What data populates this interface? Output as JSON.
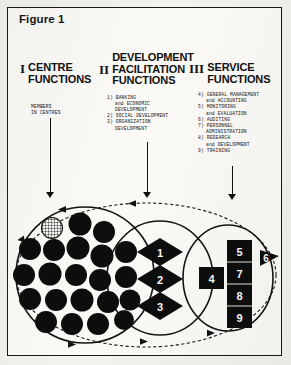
{
  "figure": {
    "title": "Figure 1"
  },
  "columns": [
    {
      "numeral": "I",
      "heading_pre": "",
      "heading_line1": "CENTRE",
      "heading_line2": "FUNCTIONS",
      "members": [
        "MEMBERS",
        " IN CENTRES"
      ],
      "items": []
    },
    {
      "numeral": "II",
      "heading_pre": "DEVELOPMENT",
      "heading_line1": "FACILITATION",
      "heading_line2": "FUNCTIONS",
      "members": [],
      "items": [
        {
          "num": "1)",
          "lines": [
            "BANKING",
            "and ECONOMIC",
            "DEVELOPMENT"
          ]
        },
        {
          "num": "2)",
          "lines": [
            "SOCIAL DEVELOPMENT"
          ]
        },
        {
          "num": "3)",
          "lines": [
            "ORGANIZATION",
            "DEVELOPMENT"
          ]
        }
      ]
    },
    {
      "numeral": "III",
      "heading_pre": "",
      "heading_line1": "SERVICE",
      "heading_line2": "FUNCTIONS",
      "members": [],
      "items": [
        {
          "num": "4)",
          "lines": [
            "GENERAL MANAGEMENT",
            "and ACCOUNTING"
          ]
        },
        {
          "num": "5)",
          "lines": [
            "MONITORING",
            "and EVALUATION"
          ]
        },
        {
          "num": "6)",
          "lines": [
            "AUDITING"
          ]
        },
        {
          "num": "7)",
          "lines": [
            "PERSONNEL",
            "ADMINISTRATION"
          ]
        },
        {
          "num": "8)",
          "lines": [
            "RESEARCH",
            "and DEVELOPMENT"
          ]
        },
        {
          "num": "9)",
          "lines": [
            "TRAINING"
          ]
        }
      ]
    }
  ],
  "diagram": {
    "centre_members_count": 20,
    "highlighted_member_style": "hatched",
    "diamonds": [
      "1",
      "2",
      "3"
    ],
    "service_boxes_stack": [
      "5",
      "7",
      "8",
      "9"
    ],
    "service_box_left": "4",
    "service_arrow_label": "6",
    "colors": {
      "ink": "#111111",
      "paper": "#fbfaf7",
      "fill_black": "#0d0d0d"
    }
  }
}
